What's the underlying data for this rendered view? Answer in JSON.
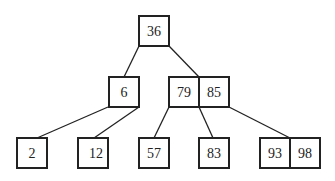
{
  "diagram": {
    "type": "b-tree",
    "root": {
      "keys": [
        "36"
      ]
    },
    "level1": [
      {
        "keys": [
          "6"
        ]
      },
      {
        "keys": [
          "79",
          "85"
        ]
      }
    ],
    "leaves": [
      {
        "keys": [
          "2"
        ]
      },
      {
        "keys": [
          "12"
        ]
      },
      {
        "keys": [
          "57"
        ]
      },
      {
        "keys": [
          "83"
        ]
      },
      {
        "keys": [
          "93",
          "98"
        ]
      }
    ],
    "edges": [
      {
        "from": "36",
        "to": "6"
      },
      {
        "from": "36",
        "to": "79|85"
      },
      {
        "from": "6",
        "to": "2"
      },
      {
        "from": "6",
        "to": "12"
      },
      {
        "from": "79|85",
        "to": "57"
      },
      {
        "from": "79|85",
        "to": "83"
      },
      {
        "from": "79|85",
        "to": "93|98"
      }
    ]
  }
}
